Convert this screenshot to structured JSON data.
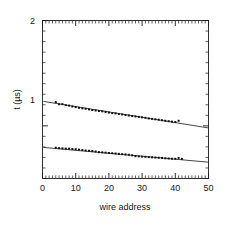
{
  "chart_data": {
    "type": "scatter",
    "title": "",
    "xlabel": "wire address",
    "ylabel": "t (µs)",
    "xlim": [
      0,
      50
    ],
    "ylim": [
      0.5,
      2.0
    ],
    "grid": false,
    "legend_position": "none",
    "xticks": [
      0,
      10,
      20,
      30,
      40,
      50
    ],
    "xtick_labels": [
      "0",
      "10",
      "20",
      "30",
      "40",
      "50"
    ],
    "yticks": [
      1,
      2
    ],
    "ytick_labels": [
      "1",
      "2"
    ],
    "x_minor_tick_step": 1,
    "y_minor_tick_step": 0.1,
    "series": [
      {
        "name": "upper branch",
        "marker": "square",
        "x": [
          4,
          5,
          6,
          7,
          8,
          9,
          10,
          11,
          12,
          13,
          14,
          15,
          16,
          17,
          18,
          19,
          20,
          21,
          22,
          23,
          24,
          25,
          26,
          27,
          28,
          29,
          30,
          31,
          32,
          33,
          34,
          35,
          36,
          37,
          38,
          39,
          40,
          41
        ],
        "values": [
          1.225,
          1.205,
          1.206,
          1.196,
          1.192,
          1.184,
          1.178,
          1.171,
          1.166,
          1.162,
          1.156,
          1.15,
          1.146,
          1.141,
          1.138,
          1.132,
          1.126,
          1.121,
          1.118,
          1.112,
          1.108,
          1.103,
          1.098,
          1.093,
          1.089,
          1.085,
          1.081,
          1.076,
          1.07,
          1.066,
          1.062,
          1.058,
          1.053,
          1.048,
          1.044,
          1.04,
          1.036,
          1.048
        ],
        "fit_line": {
          "x": [
            0.3,
            50
          ],
          "y": [
            1.232,
            0.98
          ]
        }
      },
      {
        "name": "lower branch",
        "marker": "square",
        "x": [
          4,
          5,
          6,
          7,
          8,
          9,
          10,
          11,
          12,
          13,
          14,
          15,
          16,
          17,
          18,
          19,
          20,
          21,
          22,
          23,
          24,
          25,
          26,
          27,
          28,
          29,
          30,
          31,
          32,
          33,
          34,
          35,
          36,
          37,
          38,
          39,
          40,
          41,
          42
        ],
        "values": [
          0.792,
          0.788,
          0.786,
          0.784,
          0.783,
          0.78,
          0.778,
          0.774,
          0.77,
          0.766,
          0.763,
          0.76,
          0.756,
          0.75,
          0.748,
          0.745,
          0.742,
          0.74,
          0.737,
          0.734,
          0.731,
          0.728,
          0.725,
          0.72,
          0.712,
          0.71,
          0.708,
          0.706,
          0.703,
          0.701,
          0.699,
          0.697,
          0.695,
          0.692,
          0.69,
          0.688,
          0.687,
          0.695,
          0.686
        ],
        "fit_line": {
          "x": [
            0.3,
            50
          ],
          "y": [
            0.795,
            0.655
          ]
        }
      }
    ]
  },
  "figure": {
    "xlabel": "wire address",
    "ylabel": "t (µs)",
    "ytick_top": "2",
    "ytick_mid": "1",
    "xtick_0": "0",
    "xtick_10": "10",
    "xtick_20": "20",
    "xtick_30": "30",
    "xtick_40": "40",
    "xtick_50": "50"
  },
  "colors": {
    "axis": "#1a1a1a",
    "marker": "#111111",
    "fit": "#161616",
    "background": "#ffffff"
  }
}
